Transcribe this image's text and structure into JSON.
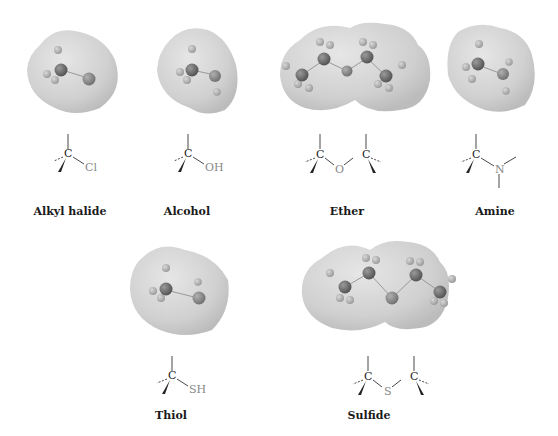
{
  "figure": {
    "title": "",
    "groups": [
      {
        "id": "alkyl-halide",
        "label": "Alkyl halide",
        "heteroatom": "Cl"
      },
      {
        "id": "alcohol",
        "label": "Alcohol",
        "heteroatom": "OH"
      },
      {
        "id": "ether",
        "label": "Ether",
        "heteroatom": "O"
      },
      {
        "id": "amine",
        "label": "Amine",
        "heteroatom": "N"
      },
      {
        "id": "thiol",
        "label": "Thiol",
        "heteroatom": "SH"
      },
      {
        "id": "sulfide",
        "label": "Sulfide",
        "heteroatom": "S"
      }
    ],
    "carbon_symbol": "C",
    "colors": {
      "surface": "#d4d4d4",
      "surface_edge": "#bdbdbd",
      "carbon_ball": "#6e6e6e",
      "hetero_ball": "#8a8a8a",
      "hydrogen_ball": "#b5b5b5",
      "bond": "#333333",
      "hetero_text": "#888888",
      "label_text": "#1a1a1a"
    }
  }
}
